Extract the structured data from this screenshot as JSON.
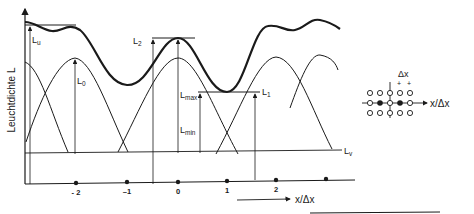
{
  "diagram": {
    "y_axis_label": "Leuchtdichte L",
    "x_axis_label": "x/Δx",
    "labels": {
      "Lu": {
        "main": "L",
        "sub": "u"
      },
      "L0": {
        "main": "L",
        "sub": "0"
      },
      "L2": {
        "main": "L",
        "sub": "2"
      },
      "Lmax": {
        "main": "L",
        "sub": "max"
      },
      "Lmin": {
        "main": "L",
        "sub": "min"
      },
      "L1": {
        "main": "L",
        "sub": "1"
      },
      "Lv": {
        "main": "L",
        "sub": "v"
      }
    },
    "x_ticks": [
      "- 2",
      "–1",
      "0",
      "1",
      "2"
    ],
    "inset": {
      "delta_label": "Δx",
      "plus_marks": [
        "+",
        "+"
      ],
      "axis_label": "x/Δx",
      "grid_rows": [
        [
          "open",
          "open",
          "open",
          "open",
          "open"
        ],
        [
          "open",
          "filled",
          "open",
          "filled",
          "open"
        ],
        [
          "open",
          "open",
          "open",
          "open",
          "open"
        ]
      ]
    },
    "colors": {
      "ink": "#1a1a1a",
      "background": "#ffffff"
    }
  }
}
